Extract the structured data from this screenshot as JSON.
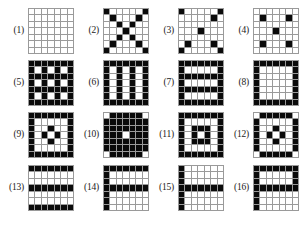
{
  "figure": {
    "title": "",
    "panel_count": 16,
    "grid_size": 7,
    "columns": 4,
    "rows": 4,
    "colors": {
      "filled_cell": "#0a0a0a",
      "empty_cell": "#ffffff",
      "gridline": "#9a9a9a",
      "label_text": "#1a1a1a",
      "background": "#ffffff"
    }
  },
  "panels": [
    {
      "label": "(1)",
      "name": "pattern-1-empty",
      "cells": [
        [
          0,
          0,
          0,
          0,
          0,
          0,
          0
        ],
        [
          0,
          0,
          0,
          0,
          0,
          0,
          0
        ],
        [
          0,
          0,
          0,
          0,
          0,
          0,
          0
        ],
        [
          0,
          0,
          0,
          0,
          0,
          0,
          0
        ],
        [
          0,
          0,
          0,
          0,
          0,
          0,
          0
        ],
        [
          0,
          0,
          0,
          0,
          0,
          0,
          0
        ],
        [
          0,
          0,
          0,
          0,
          0,
          0,
          0
        ]
      ]
    },
    {
      "label": "(2)",
      "name": "pattern-2-diagonal-cross",
      "cells": [
        [
          1,
          0,
          0,
          0,
          0,
          0,
          1
        ],
        [
          0,
          1,
          0,
          0,
          0,
          1,
          0
        ],
        [
          0,
          0,
          1,
          0,
          1,
          0,
          0
        ],
        [
          0,
          0,
          0,
          1,
          0,
          0,
          0
        ],
        [
          0,
          0,
          1,
          0,
          1,
          0,
          0
        ],
        [
          0,
          1,
          0,
          0,
          0,
          1,
          0
        ],
        [
          1,
          0,
          0,
          0,
          0,
          0,
          1
        ]
      ]
    },
    {
      "label": "(3)",
      "name": "pattern-3-corners-edges-center",
      "cells": [
        [
          1,
          0,
          0,
          0,
          0,
          0,
          1
        ],
        [
          0,
          0,
          0,
          0,
          0,
          1,
          0
        ],
        [
          0,
          0,
          0,
          0,
          0,
          0,
          0
        ],
        [
          0,
          0,
          0,
          1,
          0,
          0,
          0
        ],
        [
          0,
          0,
          0,
          0,
          0,
          0,
          0
        ],
        [
          0,
          1,
          0,
          0,
          0,
          1,
          0
        ],
        [
          1,
          0,
          0,
          0,
          0,
          0,
          1
        ]
      ]
    },
    {
      "label": "(4)",
      "name": "pattern-4-quincunx",
      "cells": [
        [
          0,
          0,
          0,
          0,
          0,
          0,
          0
        ],
        [
          0,
          1,
          0,
          0,
          0,
          1,
          0
        ],
        [
          0,
          0,
          0,
          0,
          0,
          0,
          0
        ],
        [
          0,
          0,
          0,
          1,
          0,
          0,
          0
        ],
        [
          0,
          0,
          0,
          0,
          0,
          0,
          0
        ],
        [
          0,
          1,
          0,
          0,
          0,
          1,
          0
        ],
        [
          0,
          0,
          0,
          0,
          0,
          0,
          0
        ]
      ]
    },
    {
      "label": "(5)",
      "name": "pattern-5-lattice",
      "cells": [
        [
          1,
          1,
          1,
          1,
          1,
          1,
          1
        ],
        [
          1,
          0,
          1,
          0,
          1,
          0,
          1
        ],
        [
          1,
          1,
          1,
          1,
          1,
          1,
          1
        ],
        [
          1,
          0,
          1,
          0,
          1,
          0,
          1
        ],
        [
          1,
          1,
          1,
          1,
          1,
          1,
          1
        ],
        [
          1,
          0,
          1,
          0,
          1,
          0,
          1
        ],
        [
          1,
          1,
          1,
          1,
          1,
          1,
          1
        ]
      ]
    },
    {
      "label": "(6)",
      "name": "pattern-6-vertical-stripes",
      "cells": [
        [
          1,
          1,
          1,
          1,
          1,
          1,
          1
        ],
        [
          1,
          0,
          1,
          0,
          1,
          0,
          1
        ],
        [
          1,
          0,
          1,
          0,
          1,
          0,
          1
        ],
        [
          1,
          0,
          1,
          0,
          1,
          0,
          1
        ],
        [
          1,
          0,
          1,
          0,
          1,
          0,
          1
        ],
        [
          1,
          0,
          1,
          0,
          1,
          0,
          1
        ],
        [
          1,
          1,
          1,
          1,
          1,
          1,
          1
        ]
      ]
    },
    {
      "label": "(7)",
      "name": "pattern-7-horizontal-stripes",
      "cells": [
        [
          1,
          1,
          1,
          1,
          1,
          1,
          1
        ],
        [
          1,
          0,
          0,
          0,
          0,
          0,
          1
        ],
        [
          1,
          1,
          1,
          1,
          1,
          1,
          1
        ],
        [
          1,
          0,
          0,
          0,
          0,
          0,
          1
        ],
        [
          1,
          1,
          1,
          1,
          1,
          1,
          1
        ],
        [
          1,
          0,
          0,
          0,
          0,
          0,
          1
        ],
        [
          1,
          1,
          1,
          1,
          1,
          1,
          1
        ]
      ]
    },
    {
      "label": "(8)",
      "name": "pattern-8-open-frame",
      "cells": [
        [
          1,
          1,
          1,
          1,
          1,
          1,
          1
        ],
        [
          1,
          0,
          0,
          0,
          0,
          0,
          1
        ],
        [
          1,
          0,
          0,
          0,
          0,
          0,
          1
        ],
        [
          1,
          0,
          0,
          0,
          0,
          0,
          1
        ],
        [
          1,
          0,
          0,
          0,
          0,
          0,
          1
        ],
        [
          1,
          0,
          0,
          0,
          0,
          0,
          1
        ],
        [
          1,
          1,
          1,
          1,
          1,
          1,
          1
        ]
      ]
    },
    {
      "label": "(9)",
      "name": "pattern-9-border-with-plus",
      "cells": [
        [
          1,
          1,
          1,
          1,
          1,
          1,
          1
        ],
        [
          1,
          0,
          0,
          0,
          0,
          0,
          1
        ],
        [
          1,
          0,
          0,
          1,
          0,
          0,
          1
        ],
        [
          1,
          0,
          1,
          0,
          1,
          0,
          1
        ],
        [
          1,
          0,
          0,
          1,
          0,
          0,
          1
        ],
        [
          1,
          0,
          0,
          0,
          0,
          0,
          1
        ],
        [
          1,
          1,
          1,
          1,
          1,
          1,
          1
        ]
      ]
    },
    {
      "label": "(10)",
      "name": "pattern-10-concentric-rings",
      "cells": [
        [
          0,
          1,
          1,
          1,
          1,
          1,
          0
        ],
        [
          1,
          1,
          1,
          1,
          1,
          1,
          1
        ],
        [
          1,
          1,
          1,
          1,
          1,
          1,
          1
        ],
        [
          1,
          1,
          1,
          0,
          1,
          1,
          1
        ],
        [
          1,
          1,
          1,
          1,
          1,
          1,
          1
        ],
        [
          1,
          1,
          1,
          1,
          1,
          1,
          1
        ],
        [
          0,
          1,
          1,
          1,
          1,
          1,
          0
        ]
      ]
    },
    {
      "label": "(11)",
      "name": "pattern-11-concentric-squares",
      "cells": [
        [
          1,
          1,
          1,
          1,
          1,
          1,
          1
        ],
        [
          1,
          0,
          0,
          0,
          0,
          0,
          1
        ],
        [
          1,
          0,
          1,
          1,
          1,
          0,
          1
        ],
        [
          1,
          0,
          1,
          0,
          1,
          0,
          1
        ],
        [
          1,
          0,
          1,
          1,
          1,
          0,
          1
        ],
        [
          1,
          0,
          0,
          0,
          0,
          0,
          1
        ],
        [
          1,
          1,
          1,
          1,
          1,
          1,
          1
        ]
      ]
    },
    {
      "label": "(12)",
      "name": "pattern-12-border-with-diamond",
      "cells": [
        [
          0,
          1,
          1,
          1,
          1,
          1,
          0
        ],
        [
          1,
          0,
          0,
          0,
          0,
          0,
          1
        ],
        [
          1,
          0,
          0,
          1,
          0,
          0,
          1
        ],
        [
          1,
          0,
          1,
          0,
          1,
          0,
          1
        ],
        [
          1,
          0,
          0,
          1,
          0,
          0,
          1
        ],
        [
          1,
          0,
          0,
          0,
          0,
          0,
          1
        ],
        [
          0,
          1,
          1,
          1,
          1,
          1,
          0
        ]
      ]
    },
    {
      "label": "(13)",
      "name": "pattern-13-three-horizontal-bars",
      "cells": [
        [
          1,
          1,
          1,
          1,
          1,
          1,
          1
        ],
        [
          0,
          0,
          0,
          0,
          0,
          0,
          0
        ],
        [
          0,
          0,
          0,
          0,
          0,
          0,
          0
        ],
        [
          1,
          1,
          1,
          1,
          1,
          1,
          1
        ],
        [
          0,
          0,
          0,
          0,
          0,
          0,
          0
        ],
        [
          0,
          0,
          0,
          0,
          0,
          0,
          0
        ],
        [
          1,
          1,
          1,
          1,
          1,
          1,
          1
        ]
      ]
    },
    {
      "label": "(14)",
      "name": "pattern-14-f-shape",
      "cells": [
        [
          1,
          1,
          1,
          1,
          1,
          1,
          1
        ],
        [
          1,
          0,
          0,
          0,
          0,
          0,
          0
        ],
        [
          1,
          0,
          0,
          0,
          0,
          0,
          0
        ],
        [
          1,
          1,
          1,
          1,
          1,
          1,
          1
        ],
        [
          1,
          0,
          0,
          0,
          0,
          0,
          0
        ],
        [
          1,
          0,
          0,
          0,
          0,
          0,
          0
        ],
        [
          1,
          0,
          0,
          0,
          0,
          0,
          0
        ]
      ]
    },
    {
      "label": "(15)",
      "name": "pattern-15-left-bar-with-middle",
      "cells": [
        [
          1,
          0,
          0,
          0,
          0,
          0,
          0
        ],
        [
          1,
          0,
          0,
          0,
          0,
          0,
          0
        ],
        [
          1,
          0,
          0,
          0,
          0,
          0,
          0
        ],
        [
          1,
          1,
          1,
          1,
          1,
          1,
          1
        ],
        [
          1,
          0,
          0,
          0,
          0,
          0,
          0
        ],
        [
          1,
          0,
          0,
          0,
          0,
          0,
          0
        ],
        [
          1,
          0,
          0,
          0,
          0,
          0,
          0
        ]
      ]
    },
    {
      "label": "(16)",
      "name": "pattern-16-top-and-middle-bars",
      "cells": [
        [
          1,
          1,
          1,
          1,
          1,
          1,
          1
        ],
        [
          1,
          0,
          0,
          0,
          0,
          0,
          1
        ],
        [
          1,
          0,
          0,
          0,
          0,
          0,
          1
        ],
        [
          1,
          1,
          1,
          1,
          1,
          1,
          1
        ],
        [
          1,
          0,
          0,
          0,
          0,
          0,
          0
        ],
        [
          1,
          0,
          0,
          0,
          0,
          0,
          0
        ],
        [
          1,
          0,
          0,
          0,
          0,
          0,
          0
        ]
      ]
    }
  ]
}
